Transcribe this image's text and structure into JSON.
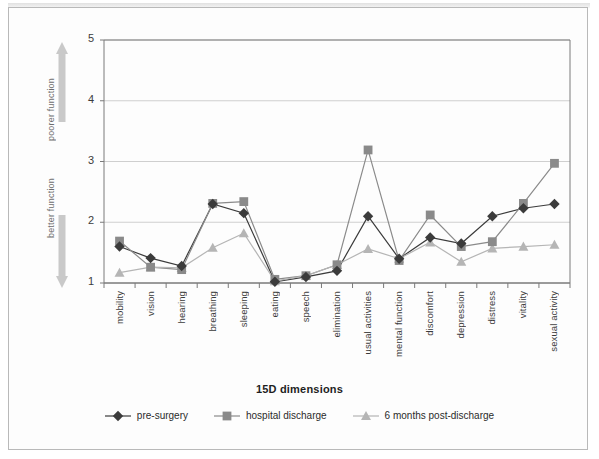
{
  "chart_data": {
    "type": "line",
    "title": "",
    "xlabel": "15D dimensions",
    "ylabel": "",
    "ylim": [
      1,
      5
    ],
    "yticks": [
      1,
      2,
      3,
      4,
      5
    ],
    "grid": "horizontal",
    "legend_position": "bottom",
    "categories": [
      "mobility",
      "vision",
      "hearing",
      "breathing",
      "sleeping",
      "eating",
      "speech",
      "elimination",
      "usual activities",
      "mental function",
      "discomfort",
      "depression",
      "distress",
      "vitality",
      "sexual activity"
    ],
    "series": [
      {
        "name": "pre-surgery",
        "marker": "diamond",
        "color": "#3b3b3b",
        "values": [
          1.6,
          1.41,
          1.28,
          2.3,
          2.15,
          1.02,
          1.1,
          1.2,
          2.1,
          1.4,
          1.75,
          1.65,
          2.1,
          2.23,
          2.3
        ]
      },
      {
        "name": "hospital discharge",
        "marker": "square",
        "color": "#8a8a8a",
        "values": [
          1.69,
          1.26,
          1.22,
          2.31,
          2.34,
          1.06,
          1.12,
          1.3,
          3.19,
          1.37,
          2.12,
          1.6,
          1.68,
          2.31,
          2.97
        ]
      },
      {
        "name": "6 months post-discharge",
        "marker": "triangle",
        "color": "#b5b5b5",
        "values": [
          1.17,
          1.26,
          1.25,
          1.58,
          1.82,
          1.03,
          1.12,
          1.3,
          1.56,
          1.4,
          1.67,
          1.35,
          1.57,
          1.6,
          1.63
        ]
      }
    ],
    "annotations": [
      {
        "id": "poorer",
        "text": "poorer\nfunction",
        "direction": "up",
        "line1": "poorer",
        "line2": "function"
      },
      {
        "id": "better",
        "text": "better\nfunction",
        "direction": "down",
        "line1": "better",
        "line2": "function"
      }
    ]
  },
  "axis": {
    "y_ticks": [
      "1",
      "2",
      "3",
      "4",
      "5"
    ],
    "x_title": "15D dimensions"
  },
  "annotations": {
    "poorer": "poorer function",
    "better": "better function"
  },
  "legend": {
    "items": [
      {
        "label": "pre-surgery",
        "marker": "diamond-marker-icon",
        "color": "#3b3b3b"
      },
      {
        "label": "hospital discharge",
        "marker": "square-marker-icon",
        "color": "#8a8a8a"
      },
      {
        "label": "6 months post-discharge",
        "marker": "triangle-marker-icon",
        "color": "#b5b5b5"
      }
    ]
  },
  "colors": {
    "pre_surgery": "#3b3b3b",
    "hospital_discharge": "#8a8a8a",
    "post_discharge": "#b5b5b5",
    "gridline": "#cfcfcf",
    "axis": "#7a7a7a",
    "frame": "#b9b9b9"
  }
}
